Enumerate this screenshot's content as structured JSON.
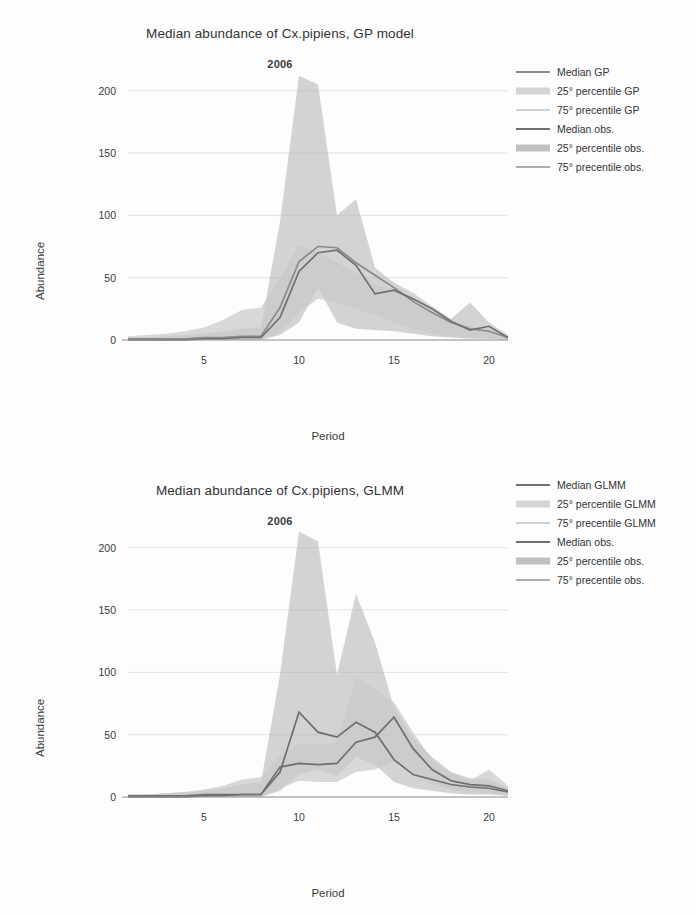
{
  "page": {
    "background": "#fdfdfd",
    "width": 697,
    "height": 917
  },
  "colors": {
    "median_model": "#8a8a8a",
    "band_model_25": "#c9c9c9",
    "band_model_75": "#d8d8d8",
    "median_obs": "#6f6f6f",
    "band_obs_25": "#b0b0b0",
    "band_obs_75": "#bdbdbd",
    "axis": "#8c8c8c",
    "grid": "#e3e3e3",
    "text": "#3a3a3a"
  },
  "figures": [
    {
      "id": "gp",
      "title": "Median abundance of Cx.pipiens, GP model",
      "annotation": "2006",
      "axis": {
        "xlabel": "Period",
        "ylabel": "Abundance",
        "xticks": [
          5,
          10,
          15,
          20
        ],
        "yticks": [
          0,
          50,
          100,
          150,
          200
        ],
        "xlim": [
          1,
          21
        ],
        "ylim": [
          0,
          215
        ],
        "grid": true
      },
      "legend": {
        "position": "right",
        "entries": [
          {
            "label": "Median GP",
            "type": "line",
            "color": "#8a8a8a"
          },
          {
            "label": "25° percentile GP",
            "type": "band",
            "color": "#c9c9c9"
          },
          {
            "label": "75° precentile GP",
            "type": "line",
            "color": "#cfcfcf"
          },
          {
            "label": "Median obs.",
            "type": "line",
            "color": "#6f6f6f"
          },
          {
            "label": "25° percentile obs.",
            "type": "band",
            "color": "#b0b0b0"
          },
          {
            "label": "75° precentile obs.",
            "type": "line",
            "color": "#adadad"
          }
        ]
      }
    },
    {
      "id": "glmm",
      "title": "Median abundance of Cx.pipiens, GLMM",
      "annotation": "2006",
      "axis": {
        "xlabel": "Period",
        "ylabel": "Abundance",
        "xticks": [
          5,
          10,
          15,
          20
        ],
        "yticks": [
          0,
          50,
          100,
          150,
          200
        ],
        "xlim": [
          1,
          21
        ],
        "ylim": [
          0,
          215
        ],
        "grid": true
      },
      "legend": {
        "position": "right",
        "entries": [
          {
            "label": "Median GLMM",
            "type": "line",
            "color": "#6f6f6f"
          },
          {
            "label": "25° percentile GLMM",
            "type": "band",
            "color": "#c9c9c9"
          },
          {
            "label": "75° precentile GLMM",
            "type": "line",
            "color": "#cfcfcf"
          },
          {
            "label": "Median obs.",
            "type": "line",
            "color": "#6f6f6f"
          },
          {
            "label": "25° percentile obs.",
            "type": "band",
            "color": "#b0b0b0"
          },
          {
            "label": "75° precentile obs.",
            "type": "line",
            "color": "#adadad"
          }
        ]
      }
    }
  ],
  "chart_data": [
    {
      "type": "line",
      "id": "gp",
      "title": "Median abundance of Cx.pipiens, GP model",
      "annotation": "2006",
      "xlabel": "Period",
      "ylabel": "Abundance",
      "xlim": [
        1,
        21
      ],
      "ylim": [
        0,
        215
      ],
      "xticks": [
        5,
        10,
        15,
        20
      ],
      "yticks": [
        0,
        50,
        100,
        150,
        200
      ],
      "grid": true,
      "legend_position": "right",
      "x": [
        1,
        2,
        3,
        4,
        5,
        6,
        7,
        8,
        9,
        10,
        11,
        12,
        13,
        14,
        15,
        16,
        17,
        18,
        19,
        20,
        21
      ],
      "series": [
        {
          "name": "Median GP",
          "role": "median_model",
          "color": "#8a8a8a",
          "values": [
            1,
            1,
            1,
            1,
            2,
            2,
            3,
            3,
            26,
            63,
            75,
            74,
            62,
            52,
            42,
            31,
            22,
            14,
            9,
            7,
            2
          ]
        },
        {
          "name": "25° percentile GP",
          "role": "lower_model",
          "color": "#c9c9c9",
          "values": [
            0,
            0,
            0,
            0,
            0,
            0,
            0,
            0,
            6,
            22,
            33,
            30,
            25,
            20,
            14,
            9,
            5,
            3,
            2,
            1,
            0
          ]
        },
        {
          "name": "75° precentile GP",
          "role": "upper_model",
          "color": "#cfcfcf",
          "values": [
            3,
            4,
            5,
            7,
            10,
            16,
            24,
            26,
            50,
            76,
            70,
            62,
            54,
            45,
            40,
            31,
            23,
            15,
            11,
            9,
            3
          ]
        },
        {
          "name": "Median obs.",
          "role": "median_obs",
          "color": "#6f6f6f",
          "values": [
            0,
            0,
            0,
            0,
            1,
            1,
            2,
            2,
            18,
            55,
            70,
            72,
            60,
            37,
            40,
            33,
            25,
            15,
            8,
            11,
            2
          ]
        },
        {
          "name": "25° percentile obs.",
          "role": "lower_obs",
          "color": "#b0b0b0",
          "values": [
            0,
            0,
            0,
            0,
            0,
            0,
            0,
            0,
            4,
            14,
            42,
            14,
            9,
            8,
            7,
            5,
            3,
            2,
            1,
            1,
            0
          ]
        },
        {
          "name": "75° precentile obs.",
          "role": "upper_obs",
          "color": "#adadad",
          "values": [
            2,
            2,
            3,
            4,
            5,
            7,
            9,
            10,
            95,
            212,
            205,
            100,
            113,
            58,
            46,
            38,
            27,
            17,
            30,
            14,
            4
          ]
        }
      ]
    },
    {
      "type": "line",
      "id": "glmm",
      "title": "Median abundance of Cx.pipiens, GLMM",
      "annotation": "2006",
      "xlabel": "Period",
      "ylabel": "Abundance",
      "xlim": [
        1,
        21
      ],
      "ylim": [
        0,
        215
      ],
      "xticks": [
        5,
        10,
        15,
        20
      ],
      "yticks": [
        0,
        50,
        100,
        150,
        200
      ],
      "grid": true,
      "legend_position": "right",
      "x": [
        1,
        2,
        3,
        4,
        5,
        6,
        7,
        8,
        9,
        10,
        11,
        12,
        13,
        14,
        15,
        16,
        17,
        18,
        19,
        20,
        21
      ],
      "series": [
        {
          "name": "Median GLMM",
          "role": "median_model",
          "color": "#6f6f6f",
          "values": [
            1,
            1,
            1,
            1,
            2,
            2,
            2,
            2,
            24,
            27,
            26,
            27,
            44,
            48,
            64,
            39,
            22,
            13,
            10,
            9,
            5
          ]
        },
        {
          "name": "25° percentile GLMM",
          "role": "lower_model",
          "color": "#c9c9c9",
          "values": [
            0,
            0,
            0,
            0,
            0,
            0,
            0,
            0,
            7,
            13,
            12,
            12,
            20,
            22,
            28,
            18,
            10,
            6,
            4,
            3,
            1
          ]
        },
        {
          "name": "75° precentile GLMM",
          "role": "upper_model",
          "color": "#cfcfcf",
          "values": [
            2,
            2,
            3,
            4,
            6,
            9,
            14,
            16,
            33,
            43,
            42,
            44,
            96,
            86,
            76,
            52,
            30,
            19,
            13,
            22,
            9
          ]
        },
        {
          "name": "Median obs.",
          "role": "median_obs",
          "color": "#6f6f6f",
          "values": [
            0,
            0,
            0,
            0,
            1,
            1,
            2,
            2,
            20,
            68,
            52,
            48,
            60,
            52,
            30,
            18,
            14,
            10,
            8,
            7,
            4
          ]
        },
        {
          "name": "25° percentile obs.",
          "role": "lower_obs",
          "color": "#b0b0b0",
          "values": [
            0,
            0,
            0,
            0,
            0,
            0,
            0,
            0,
            5,
            18,
            22,
            17,
            32,
            26,
            12,
            7,
            5,
            3,
            2,
            2,
            1
          ]
        },
        {
          "name": "75° precentile obs.",
          "role": "upper_obs",
          "color": "#adadad",
          "values": [
            2,
            2,
            3,
            4,
            5,
            7,
            10,
            12,
            98,
            213,
            205,
            98,
            163,
            124,
            72,
            48,
            32,
            20,
            15,
            14,
            7
          ]
        }
      ]
    }
  ]
}
